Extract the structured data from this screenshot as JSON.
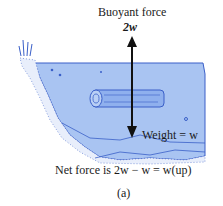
{
  "figure": {
    "buoyant_label": "Buoyant force",
    "buoyant_value": "2w",
    "weight_label": "Weight = w",
    "net_force_text": "Net force is 2w − w = w(up)",
    "caption": "(a)"
  },
  "colors": {
    "water": "#a9c4f2",
    "outline": "#3a5fc8",
    "arrow": "#111111",
    "text": "#1a1a1a"
  }
}
